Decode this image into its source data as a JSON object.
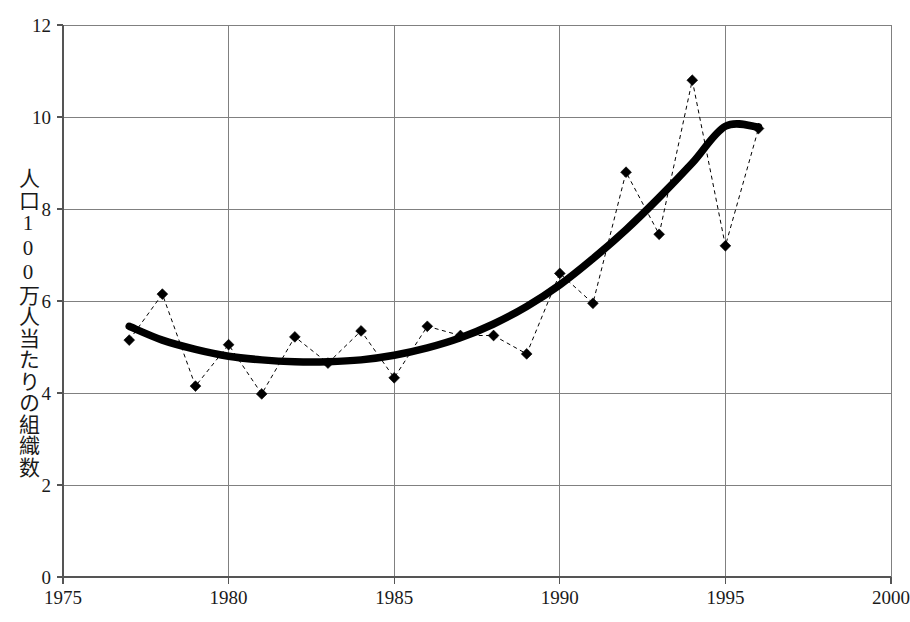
{
  "chart_data": {
    "type": "line",
    "title": "",
    "subtitle": "",
    "xlabel": "",
    "ylabel": "人口100万人当たりの組織数",
    "xlim": [
      1975,
      2000
    ],
    "ylim": [
      0,
      12
    ],
    "x_ticks": [
      1975,
      1980,
      1985,
      1990,
      1995,
      2000
    ],
    "y_ticks": [
      0,
      2,
      4,
      6,
      8,
      10,
      12
    ],
    "grid": true,
    "legend": "none",
    "x": [
      1977,
      1978,
      1979,
      1980,
      1981,
      1982,
      1983,
      1984,
      1985,
      1986,
      1987,
      1988,
      1989,
      1990,
      1991,
      1992,
      1993,
      1994,
      1995,
      1996
    ],
    "series": [
      {
        "name": "人口100万人当たりの組織数",
        "style": "dashed-with-diamond-markers",
        "color": "#000000",
        "values": [
          5.15,
          6.15,
          4.15,
          5.05,
          3.98,
          5.22,
          4.65,
          5.35,
          4.33,
          5.45,
          5.25,
          5.25,
          4.85,
          6.6,
          5.95,
          8.8,
          7.45,
          10.8,
          7.2,
          9.75
        ]
      },
      {
        "name": "近似曲線",
        "style": "thick-smooth-trend",
        "color": "#000000",
        "values": [
          5.45,
          5.15,
          4.95,
          4.8,
          4.72,
          4.68,
          4.68,
          4.72,
          4.82,
          4.98,
          5.2,
          5.5,
          5.88,
          6.35,
          6.92,
          7.55,
          8.25,
          9.0,
          9.8,
          9.78
        ]
      }
    ]
  },
  "axes": {
    "x_tick_labels": [
      "1975",
      "1980",
      "1985",
      "1990",
      "1995",
      "2000"
    ],
    "y_tick_labels": [
      "0",
      "2",
      "4",
      "6",
      "8",
      "10",
      "12"
    ]
  },
  "colors": {
    "background": "#ffffff",
    "gridline": "#808080",
    "axis": "#555555",
    "data": "#000000",
    "trend": "#000000",
    "text": "#1a1a1a"
  }
}
